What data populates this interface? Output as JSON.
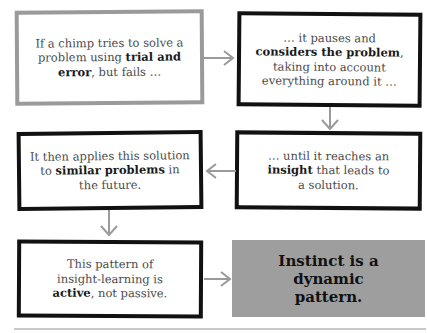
{
  "diagram": {
    "steps": [
      {
        "pre": "If a chimp tries to solve a problem using ",
        "bold": "trial and error",
        "post": ", but fails …"
      },
      {
        "pre": "… it pauses and ",
        "bold": "considers the problem",
        "post": ", taking into account everything around it …"
      },
      {
        "pre": "… until it reaches an ",
        "bold": "insight",
        "post": " that leads to a solution."
      },
      {
        "pre": "It then applies this solution to ",
        "bold": "similar problems",
        "post": " in the future."
      },
      {
        "pre": "This pattern of insight-learning is ",
        "bold": "active",
        "post": ", not passive."
      }
    ],
    "conclusion": "Instinct is a dynamic pattern.",
    "colors": {
      "arrow": "#9a9a9a",
      "conclusion_fill": "#9e9e9e",
      "box_border": "#111111",
      "first_box_border": "#9a9a9a"
    }
  }
}
